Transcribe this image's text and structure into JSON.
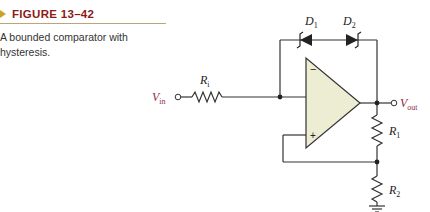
{
  "figure": {
    "number": "FIGURE 13–42",
    "caption": "A bounded comparator with hysteresis.",
    "accent_color": "#8b1a1a",
    "marker_color": "#c9a227",
    "opamp_fill": "#ecedd3"
  },
  "circuit": {
    "input_label": "V",
    "input_sub": "in",
    "output_label": "V",
    "output_sub": "out",
    "resistor_input": {
      "label": "R",
      "sub": "i"
    },
    "resistor_1": {
      "label": "R",
      "sub": "1"
    },
    "resistor_2": {
      "label": "R",
      "sub": "2"
    },
    "diode_1": {
      "label": "D",
      "sub": "1"
    },
    "diode_2": {
      "label": "D",
      "sub": "2"
    },
    "opamp_inverting": "−",
    "opamp_noninverting": "+"
  }
}
